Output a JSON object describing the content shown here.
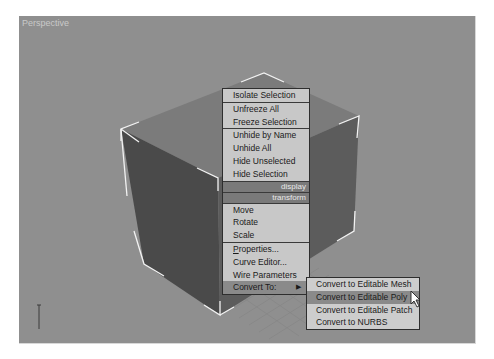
{
  "viewport": {
    "label": "Perspective",
    "background_color": "#8f8f8f",
    "axis_label": "z"
  },
  "quad_menu": {
    "sections": [
      {
        "items": [
          {
            "label": "Isolate Selection"
          }
        ]
      },
      {
        "items": [
          {
            "label": "Unfreeze All"
          },
          {
            "label": "Freeze Selection"
          }
        ]
      },
      {
        "items": [
          {
            "label": "Unhide by Name"
          },
          {
            "label": "Unhide All"
          },
          {
            "label": "Hide Unselected"
          },
          {
            "label": "Hide Selection"
          }
        ]
      }
    ],
    "headers": {
      "display": "display",
      "transform": "transform"
    },
    "transform_items": [
      {
        "label": "Move"
      },
      {
        "label": "Rotate"
      },
      {
        "label": "Scale"
      }
    ],
    "misc_items": [
      {
        "label_mnemonic": "P",
        "label_rest": "roperties..."
      },
      {
        "label": "Curve Editor..."
      },
      {
        "label": "Wire Parameters"
      }
    ],
    "convert_item": {
      "label": "Convert To:",
      "arrow": "▶"
    }
  },
  "submenu": {
    "items": [
      {
        "label": "Convert to Editable Mesh"
      },
      {
        "label": "Convert to Editable Poly",
        "highlighted": true
      },
      {
        "label": "Convert to Editable Patch"
      },
      {
        "label": "Convert to NURBS"
      }
    ]
  },
  "colors": {
    "menu_bg": "#c8c8c8",
    "menu_header_bg": "#7a7a7a",
    "menu_highlight": "#8a8a8a",
    "box_top": "#7b7b7b",
    "box_left": "#4a4a4a",
    "box_right": "#5f5f5f",
    "selection_edge": "#f2f2f2"
  }
}
